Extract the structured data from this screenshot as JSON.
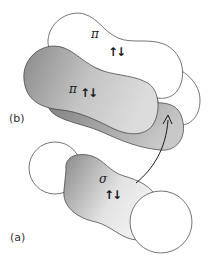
{
  "diagram": {
    "panels": {
      "b": {
        "label": "(b)"
      },
      "a": {
        "label": "(a)"
      }
    },
    "orbitals": {
      "pi_back": {
        "symbol": "π",
        "spin": "↑↓"
      },
      "pi_front": {
        "symbol": "π",
        "spin": "↑↓"
      },
      "sigma": {
        "symbol": "σ",
        "spin": "↑↓"
      }
    },
    "colors": {
      "outline": "#3a3a3a",
      "lobe_white": "#ffffff",
      "lobe_gray_dark": "#8c8c8c",
      "lobe_gray_light": "#e6e6e6"
    }
  }
}
